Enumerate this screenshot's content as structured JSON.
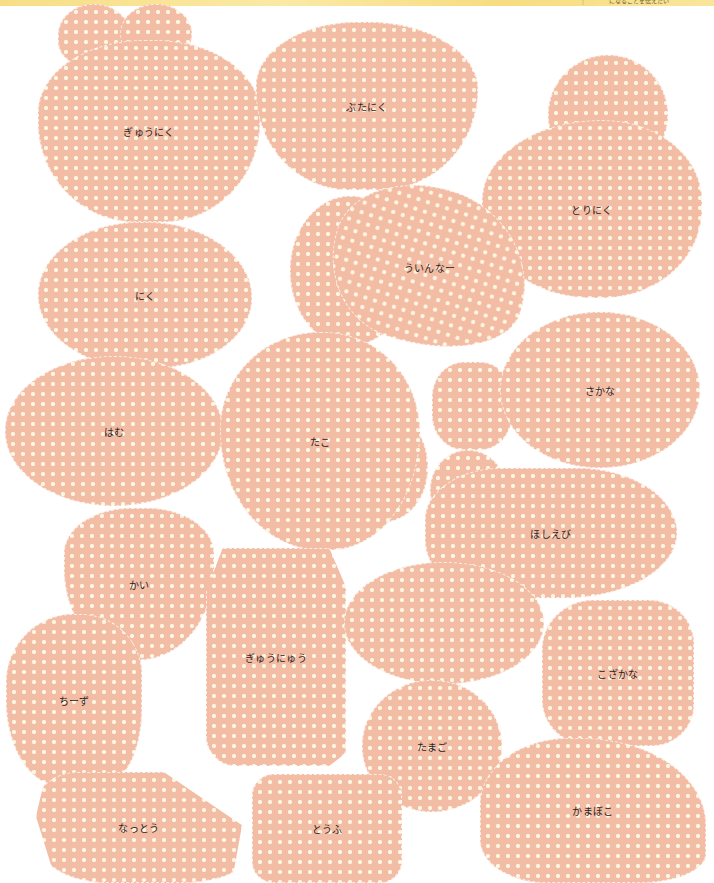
{
  "banner": {
    "mark": "⋮",
    "text": "になることを伝えたい"
  },
  "colors": {
    "card_fill": "#f3bda5",
    "dot": "#fff6e2",
    "banner": "#f7de86",
    "label_text": "#2a2220"
  },
  "cards": [
    {
      "label": "ぎゅうにく"
    },
    {
      "label": "ぶたにく"
    },
    {
      "label": "とりにく"
    },
    {
      "label": "にく"
    },
    {
      "label": "ういんなー"
    },
    {
      "label": "はむ"
    },
    {
      "label": "たこ"
    },
    {
      "label": "さかな"
    },
    {
      "label": "ほしえび"
    },
    {
      "label": "かい"
    },
    {
      "label": "ぎゅうにゅう"
    },
    {
      "label": "ちーず"
    },
    {
      "label": "たまご"
    },
    {
      "label": "こざかな"
    },
    {
      "label": "なっとう"
    },
    {
      "label": "とうふ"
    },
    {
      "label": "かまぼこ"
    }
  ]
}
